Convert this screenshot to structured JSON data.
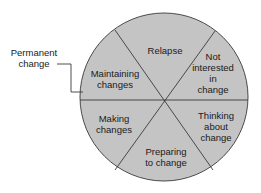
{
  "diagram": {
    "type": "cycle-wheel",
    "colors": {
      "fill": "#c4c4c4",
      "stroke": "#4a4a4a",
      "text": "#1a1a1a"
    },
    "segments": [
      {
        "id": "relapse",
        "lines": [
          "Relapse"
        ]
      },
      {
        "id": "not-interested",
        "lines": [
          "Not",
          "interested",
          "in",
          "change"
        ]
      },
      {
        "id": "thinking",
        "lines": [
          "Thinking",
          "about",
          "change"
        ]
      },
      {
        "id": "preparing",
        "lines": [
          "Preparing",
          "to change"
        ]
      },
      {
        "id": "making",
        "lines": [
          "Making",
          "changes"
        ]
      },
      {
        "id": "maintaining",
        "lines": [
          "Maintaining",
          "changes"
        ]
      }
    ],
    "external_label": {
      "lines": [
        "Permanent",
        "change"
      ]
    }
  }
}
